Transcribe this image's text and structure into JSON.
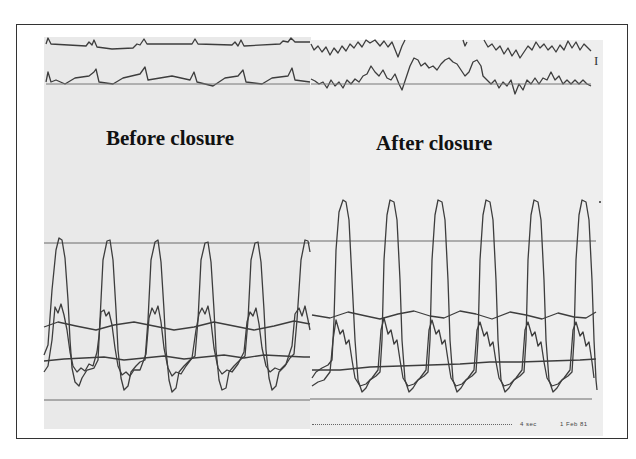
{
  "figure": {
    "panels": [
      {
        "id": "before",
        "label": "Before closure"
      },
      {
        "id": "after",
        "label": "After closure"
      }
    ],
    "channel_marker": "I",
    "footer": {
      "paper_speed": "4 sec",
      "date": "1 Feb 81"
    },
    "traces": {
      "top_channels": [
        "ECG lead (top)",
        "ECG lead (second)"
      ],
      "pressure_channels": [
        "systolic pressure wave",
        "secondary pressure wave",
        "mean pressure baseline"
      ]
    },
    "colors": {
      "trace": "#3a3a3a",
      "strip_background": "#ececec",
      "frame": "#333333"
    }
  }
}
